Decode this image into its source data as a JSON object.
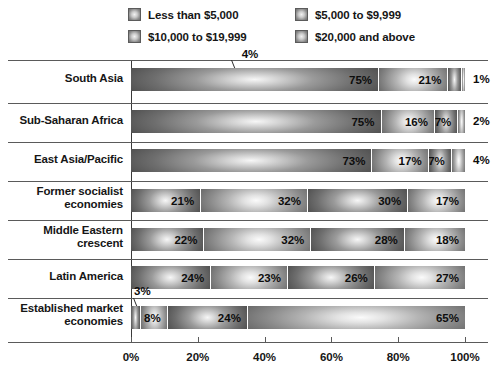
{
  "chart_data": {
    "type": "bar",
    "orientation": "horizontal",
    "stacked": true,
    "stack_mode": "percent",
    "title": "",
    "subtitle": "",
    "xlabel": "",
    "ylabel": "",
    "xlim": [
      0,
      100
    ],
    "xticks": [
      0,
      20,
      40,
      60,
      80,
      100
    ],
    "xticklabels": [
      "0%",
      "20%",
      "40%",
      "60%",
      "80%",
      "100%"
    ],
    "grid": false,
    "legend_position": "top",
    "legend": [
      "Less than $5,000",
      "$5,000 to $9,999",
      "$10,000 to $19,999",
      "$20,000 and above"
    ],
    "categories": [
      "South Asia",
      "Sub-Saharan Africa",
      "East Asia/Pacific",
      "Former socialist economies",
      "Middle Eastern crescent",
      "Latin America",
      "Established market economies"
    ],
    "series": [
      {
        "name": "Less than $5,000",
        "values": [
          75,
          75,
          73,
          21,
          22,
          24,
          3
        ]
      },
      {
        "name": "$5,000 to $9,999",
        "values": [
          21,
          16,
          17,
          32,
          32,
          23,
          8
        ]
      },
      {
        "name": "$10,000 to $19,999",
        "values": [
          4,
          7,
          7,
          30,
          28,
          26,
          24
        ]
      },
      {
        "name": "$20,000 and above",
        "values": [
          1,
          2,
          4,
          17,
          18,
          27,
          65
        ]
      }
    ]
  },
  "legend": {
    "items": [
      {
        "label": "Less than $5,000",
        "swatch": "gradient-swatch-icon"
      },
      {
        "label": "$5,000 to $9,999",
        "swatch": "gradient-swatch-icon"
      },
      {
        "label": "$10,000 to $19,999",
        "swatch": "gradient-swatch-icon"
      },
      {
        "label": "$20,000 and above",
        "swatch": "gradient-swatch-icon"
      }
    ]
  },
  "rows": [
    {
      "label_line1": "South Asia",
      "label_line2": "",
      "segments": [
        {
          "value": 75,
          "text": "75%",
          "inside": true
        },
        {
          "value": 21,
          "text": "21%",
          "inside": true
        },
        {
          "value": 4,
          "text": "4%",
          "inside": false,
          "callout": true
        },
        {
          "value": 1,
          "text": "1%",
          "inside": false,
          "callout": false
        }
      ]
    },
    {
      "label_line1": "Sub-Saharan Africa",
      "label_line2": "",
      "segments": [
        {
          "value": 75,
          "text": "75%",
          "inside": true
        },
        {
          "value": 16,
          "text": "16%",
          "inside": true
        },
        {
          "value": 7,
          "text": "7%",
          "inside": true
        },
        {
          "value": 2,
          "text": "2%",
          "inside": false,
          "callout": false
        }
      ]
    },
    {
      "label_line1": "East Asia/Pacific",
      "label_line2": "",
      "segments": [
        {
          "value": 73,
          "text": "73%",
          "inside": true
        },
        {
          "value": 17,
          "text": "17%",
          "inside": true
        },
        {
          "value": 7,
          "text": "7%",
          "inside": true
        },
        {
          "value": 4,
          "text": "4%",
          "inside": false,
          "callout": false
        }
      ]
    },
    {
      "label_line1": "Former socialist",
      "label_line2": "economies",
      "segments": [
        {
          "value": 21,
          "text": "21%",
          "inside": true
        },
        {
          "value": 32,
          "text": "32%",
          "inside": true
        },
        {
          "value": 30,
          "text": "30%",
          "inside": true
        },
        {
          "value": 17,
          "text": "17%",
          "inside": true
        }
      ]
    },
    {
      "label_line1": "Middle Eastern",
      "label_line2": "crescent",
      "segments": [
        {
          "value": 22,
          "text": "22%",
          "inside": true
        },
        {
          "value": 32,
          "text": "32%",
          "inside": true
        },
        {
          "value": 28,
          "text": "28%",
          "inside": true
        },
        {
          "value": 18,
          "text": "18%",
          "inside": true
        }
      ]
    },
    {
      "label_line1": "Latin America",
      "label_line2": "",
      "segments": [
        {
          "value": 24,
          "text": "24%",
          "inside": true
        },
        {
          "value": 23,
          "text": "23%",
          "inside": true
        },
        {
          "value": 26,
          "text": "26%",
          "inside": true
        },
        {
          "value": 27,
          "text": "27%",
          "inside": true
        }
      ]
    },
    {
      "label_line1": "Established market",
      "label_line2": "economies",
      "segments": [
        {
          "value": 3,
          "text": "3%",
          "inside": false,
          "callout": true
        },
        {
          "value": 8,
          "text": "8%",
          "inside": true
        },
        {
          "value": 24,
          "text": "24%",
          "inside": true
        },
        {
          "value": 65,
          "text": "65%",
          "inside": true
        }
      ]
    }
  ],
  "xaxis": {
    "ticks": [
      "0%",
      "20%",
      "40%",
      "60%",
      "80%",
      "100%"
    ]
  },
  "colors": {
    "rule": "#5a5a5a",
    "axis": "#3a3a3a",
    "text": "#161616",
    "segment_light": "#fbfbfb",
    "segment_dark": "#3f3f3f",
    "background": "#ffffff"
  }
}
